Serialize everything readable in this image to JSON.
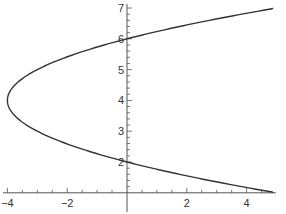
{
  "chart_data": {
    "type": "line",
    "title": "",
    "xlabel": "",
    "ylabel": "",
    "equation": "x = (y - 4)^2 - 4",
    "xlim": [
      -4.1,
      4.9
    ],
    "ylim": [
      1.0,
      7.2
    ],
    "grid": false,
    "legend": null,
    "x_axis_at_y": 1.0,
    "y_axis_at_x": 0,
    "x_ticks": [
      -4,
      -2,
      2,
      4
    ],
    "x_tick_labels": [
      "−4",
      "−2",
      "2",
      "4"
    ],
    "y_ticks": [
      2,
      3,
      4,
      5,
      6,
      7
    ],
    "y_tick_labels": [
      "2",
      "3",
      "4",
      "5",
      "6",
      "7"
    ],
    "series": [
      {
        "name": "parabola",
        "color": "#333333",
        "points": [
          {
            "x": 5.0,
            "y": 1.0
          },
          {
            "x": 2.25,
            "y": 1.5
          },
          {
            "x": 0.0,
            "y": 2.0
          },
          {
            "x": -1.75,
            "y": 2.5
          },
          {
            "x": -3.0,
            "y": 3.0
          },
          {
            "x": -3.75,
            "y": 3.5
          },
          {
            "x": -4.0,
            "y": 4.0
          },
          {
            "x": -3.75,
            "y": 4.5
          },
          {
            "x": -3.0,
            "y": 5.0
          },
          {
            "x": -1.75,
            "y": 5.5
          },
          {
            "x": 0.0,
            "y": 6.0
          },
          {
            "x": 2.25,
            "y": 6.5
          },
          {
            "x": 5.0,
            "y": 7.0
          }
        ]
      }
    ]
  }
}
